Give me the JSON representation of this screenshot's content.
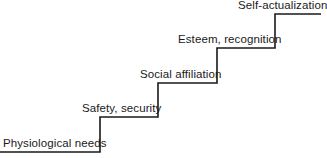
{
  "diagram": {
    "type": "staircase",
    "line_color": "#1a1a1a",
    "steps": [
      {
        "label": "Physiological needs",
        "level": 1
      },
      {
        "label": "Safety, security",
        "level": 2
      },
      {
        "label": "Social affiliation",
        "level": 3
      },
      {
        "label": "Esteem, recognition",
        "level": 4
      },
      {
        "label": "Self-actualization",
        "level": 5
      }
    ]
  }
}
